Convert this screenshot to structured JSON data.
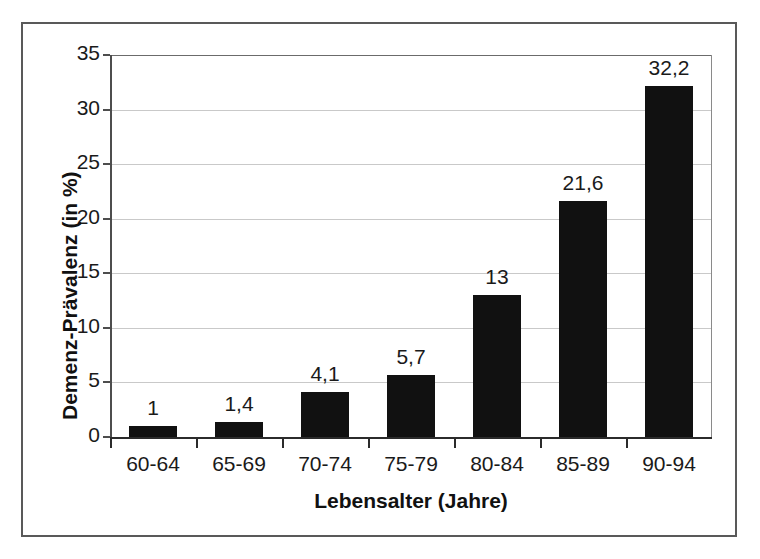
{
  "chart_data": {
    "type": "bar",
    "title": "",
    "subtitle": "",
    "xlabel": "Lebensalter (Jahre)",
    "ylabel": "Demenz-Prävalenz (in %)",
    "categories": [
      "60-64",
      "65-69",
      "70-74",
      "75-79",
      "80-84",
      "85-89",
      "90-94"
    ],
    "values": [
      1,
      1.4,
      4.1,
      5.7,
      13,
      21.6,
      32.2
    ],
    "value_labels": [
      "1",
      "1,4",
      "4,1",
      "5,7",
      "13",
      "21,6",
      "32,2"
    ],
    "ylim": [
      0,
      35
    ],
    "ytick_labels": [
      "0",
      "5",
      "10",
      "15",
      "20",
      "25",
      "30",
      "35"
    ],
    "ytick_values": [
      0,
      5,
      10,
      15,
      20,
      25,
      30,
      35
    ],
    "grid": true,
    "legend": false,
    "legend_position": "none",
    "bar_color": "#111111",
    "gridline_color": "#c9c9c9",
    "axis_color": "#2b2b2b",
    "frame_color": "#595959",
    "background_color": "#ffffff"
  }
}
